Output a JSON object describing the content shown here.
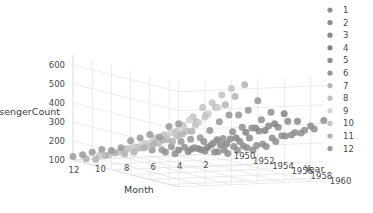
{
  "chart_data": {
    "type": "scatter",
    "title": "",
    "projection": "3d",
    "xlabel": "Month",
    "ylabel": "Year",
    "zlabel": "PassengerCount",
    "x_ticks": [
      12,
      10,
      8,
      6,
      4,
      2
    ],
    "y_ticks": [
      1950,
      1952,
      1954,
      1956,
      1958,
      1960
    ],
    "z_ticks": [
      100,
      200,
      300,
      400,
      500,
      600
    ],
    "xlim": [
      13,
      1
    ],
    "ylim": [
      1949,
      1961
    ],
    "zlim": [
      100,
      650
    ],
    "grid": true,
    "legend_title": "",
    "legend_position": "right",
    "legend_entries": [
      {
        "label": "1",
        "color": "#8e8e8e"
      },
      {
        "label": "2",
        "color": "#8c8c8c"
      },
      {
        "label": "3",
        "color": "#8a8a8a"
      },
      {
        "label": "4",
        "color": "#848484"
      },
      {
        "label": "5",
        "color": "#8f8f8f"
      },
      {
        "label": "6",
        "color": "#959595"
      },
      {
        "label": "7",
        "color": "#b4b4b4"
      },
      {
        "label": "8",
        "color": "#c2c2c2"
      },
      {
        "label": "9",
        "color": "#d2d2d2"
      },
      {
        "label": "10",
        "color": "#c4c4c4"
      },
      {
        "label": "11",
        "color": "#b0b0b0"
      },
      {
        "label": "12",
        "color": "#9a9a9a"
      }
    ],
    "series_key": "Month",
    "point_opacity": 0.85,
    "point_size": 7,
    "x": "Month",
    "y": "Year",
    "z": "PassengerCount",
    "points": [
      {
        "year": 1949,
        "month": 1,
        "value": 112
      },
      {
        "year": 1949,
        "month": 2,
        "value": 118
      },
      {
        "year": 1949,
        "month": 3,
        "value": 132
      },
      {
        "year": 1949,
        "month": 4,
        "value": 129
      },
      {
        "year": 1949,
        "month": 5,
        "value": 121
      },
      {
        "year": 1949,
        "month": 6,
        "value": 135
      },
      {
        "year": 1949,
        "month": 7,
        "value": 148
      },
      {
        "year": 1949,
        "month": 8,
        "value": 148
      },
      {
        "year": 1949,
        "month": 9,
        "value": 136
      },
      {
        "year": 1949,
        "month": 10,
        "value": 119
      },
      {
        "year": 1949,
        "month": 11,
        "value": 104
      },
      {
        "year": 1949,
        "month": 12,
        "value": 118
      },
      {
        "year": 1950,
        "month": 1,
        "value": 115
      },
      {
        "year": 1950,
        "month": 2,
        "value": 126
      },
      {
        "year": 1950,
        "month": 3,
        "value": 141
      },
      {
        "year": 1950,
        "month": 4,
        "value": 135
      },
      {
        "year": 1950,
        "month": 5,
        "value": 125
      },
      {
        "year": 1950,
        "month": 6,
        "value": 149
      },
      {
        "year": 1950,
        "month": 7,
        "value": 170
      },
      {
        "year": 1950,
        "month": 8,
        "value": 170
      },
      {
        "year": 1950,
        "month": 9,
        "value": 158
      },
      {
        "year": 1950,
        "month": 10,
        "value": 133
      },
      {
        "year": 1950,
        "month": 11,
        "value": 114
      },
      {
        "year": 1950,
        "month": 12,
        "value": 140
      },
      {
        "year": 1951,
        "month": 1,
        "value": 145
      },
      {
        "year": 1951,
        "month": 2,
        "value": 150
      },
      {
        "year": 1951,
        "month": 3,
        "value": 178
      },
      {
        "year": 1951,
        "month": 4,
        "value": 163
      },
      {
        "year": 1951,
        "month": 5,
        "value": 172
      },
      {
        "year": 1951,
        "month": 6,
        "value": 178
      },
      {
        "year": 1951,
        "month": 7,
        "value": 199
      },
      {
        "year": 1951,
        "month": 8,
        "value": 199
      },
      {
        "year": 1951,
        "month": 9,
        "value": 184
      },
      {
        "year": 1951,
        "month": 10,
        "value": 162
      },
      {
        "year": 1951,
        "month": 11,
        "value": 146
      },
      {
        "year": 1951,
        "month": 12,
        "value": 166
      },
      {
        "year": 1952,
        "month": 1,
        "value": 171
      },
      {
        "year": 1952,
        "month": 2,
        "value": 180
      },
      {
        "year": 1952,
        "month": 3,
        "value": 193
      },
      {
        "year": 1952,
        "month": 4,
        "value": 181
      },
      {
        "year": 1952,
        "month": 5,
        "value": 183
      },
      {
        "year": 1952,
        "month": 6,
        "value": 218
      },
      {
        "year": 1952,
        "month": 7,
        "value": 230
      },
      {
        "year": 1952,
        "month": 8,
        "value": 242
      },
      {
        "year": 1952,
        "month": 9,
        "value": 209
      },
      {
        "year": 1952,
        "month": 10,
        "value": 191
      },
      {
        "year": 1952,
        "month": 11,
        "value": 172
      },
      {
        "year": 1952,
        "month": 12,
        "value": 194
      },
      {
        "year": 1953,
        "month": 1,
        "value": 196
      },
      {
        "year": 1953,
        "month": 2,
        "value": 196
      },
      {
        "year": 1953,
        "month": 3,
        "value": 236
      },
      {
        "year": 1953,
        "month": 4,
        "value": 235
      },
      {
        "year": 1953,
        "month": 5,
        "value": 229
      },
      {
        "year": 1953,
        "month": 6,
        "value": 243
      },
      {
        "year": 1953,
        "month": 7,
        "value": 264
      },
      {
        "year": 1953,
        "month": 8,
        "value": 272
      },
      {
        "year": 1953,
        "month": 9,
        "value": 237
      },
      {
        "year": 1953,
        "month": 10,
        "value": 211
      },
      {
        "year": 1953,
        "month": 11,
        "value": 180
      },
      {
        "year": 1953,
        "month": 12,
        "value": 201
      },
      {
        "year": 1954,
        "month": 1,
        "value": 204
      },
      {
        "year": 1954,
        "month": 2,
        "value": 188
      },
      {
        "year": 1954,
        "month": 3,
        "value": 235
      },
      {
        "year": 1954,
        "month": 4,
        "value": 227
      },
      {
        "year": 1954,
        "month": 5,
        "value": 234
      },
      {
        "year": 1954,
        "month": 6,
        "value": 264
      },
      {
        "year": 1954,
        "month": 7,
        "value": 302
      },
      {
        "year": 1954,
        "month": 8,
        "value": 293
      },
      {
        "year": 1954,
        "month": 9,
        "value": 259
      },
      {
        "year": 1954,
        "month": 10,
        "value": 229
      },
      {
        "year": 1954,
        "month": 11,
        "value": 203
      },
      {
        "year": 1954,
        "month": 12,
        "value": 229
      },
      {
        "year": 1955,
        "month": 1,
        "value": 242
      },
      {
        "year": 1955,
        "month": 2,
        "value": 233
      },
      {
        "year": 1955,
        "month": 3,
        "value": 267
      },
      {
        "year": 1955,
        "month": 4,
        "value": 269
      },
      {
        "year": 1955,
        "month": 5,
        "value": 270
      },
      {
        "year": 1955,
        "month": 6,
        "value": 315
      },
      {
        "year": 1955,
        "month": 7,
        "value": 364
      },
      {
        "year": 1955,
        "month": 8,
        "value": 347
      },
      {
        "year": 1955,
        "month": 9,
        "value": 312
      },
      {
        "year": 1955,
        "month": 10,
        "value": 274
      },
      {
        "year": 1955,
        "month": 11,
        "value": 237
      },
      {
        "year": 1955,
        "month": 12,
        "value": 278
      },
      {
        "year": 1956,
        "month": 1,
        "value": 284
      },
      {
        "year": 1956,
        "month": 2,
        "value": 277
      },
      {
        "year": 1956,
        "month": 3,
        "value": 317
      },
      {
        "year": 1956,
        "month": 4,
        "value": 313
      },
      {
        "year": 1956,
        "month": 5,
        "value": 318
      },
      {
        "year": 1956,
        "month": 6,
        "value": 374
      },
      {
        "year": 1956,
        "month": 7,
        "value": 413
      },
      {
        "year": 1956,
        "month": 8,
        "value": 405
      },
      {
        "year": 1956,
        "month": 9,
        "value": 355
      },
      {
        "year": 1956,
        "month": 10,
        "value": 306
      },
      {
        "year": 1956,
        "month": 11,
        "value": 271
      },
      {
        "year": 1956,
        "month": 12,
        "value": 306
      },
      {
        "year": 1957,
        "month": 1,
        "value": 315
      },
      {
        "year": 1957,
        "month": 2,
        "value": 301
      },
      {
        "year": 1957,
        "month": 3,
        "value": 356
      },
      {
        "year": 1957,
        "month": 4,
        "value": 348
      },
      {
        "year": 1957,
        "month": 5,
        "value": 355
      },
      {
        "year": 1957,
        "month": 6,
        "value": 422
      },
      {
        "year": 1957,
        "month": 7,
        "value": 465
      },
      {
        "year": 1957,
        "month": 8,
        "value": 467
      },
      {
        "year": 1957,
        "month": 9,
        "value": 404
      },
      {
        "year": 1957,
        "month": 10,
        "value": 347
      },
      {
        "year": 1957,
        "month": 11,
        "value": 305
      },
      {
        "year": 1957,
        "month": 12,
        "value": 336
      },
      {
        "year": 1958,
        "month": 1,
        "value": 340
      },
      {
        "year": 1958,
        "month": 2,
        "value": 318
      },
      {
        "year": 1958,
        "month": 3,
        "value": 362
      },
      {
        "year": 1958,
        "month": 4,
        "value": 348
      },
      {
        "year": 1958,
        "month": 5,
        "value": 363
      },
      {
        "year": 1958,
        "month": 6,
        "value": 435
      },
      {
        "year": 1958,
        "month": 7,
        "value": 491
      },
      {
        "year": 1958,
        "month": 8,
        "value": 505
      },
      {
        "year": 1958,
        "month": 9,
        "value": 404
      },
      {
        "year": 1958,
        "month": 10,
        "value": 359
      },
      {
        "year": 1958,
        "month": 11,
        "value": 310
      },
      {
        "year": 1958,
        "month": 12,
        "value": 337
      },
      {
        "year": 1959,
        "month": 1,
        "value": 360
      },
      {
        "year": 1959,
        "month": 2,
        "value": 342
      },
      {
        "year": 1959,
        "month": 3,
        "value": 406
      },
      {
        "year": 1959,
        "month": 4,
        "value": 396
      },
      {
        "year": 1959,
        "month": 5,
        "value": 420
      },
      {
        "year": 1959,
        "month": 6,
        "value": 472
      },
      {
        "year": 1959,
        "month": 7,
        "value": 548
      },
      {
        "year": 1959,
        "month": 8,
        "value": 559
      },
      {
        "year": 1959,
        "month": 9,
        "value": 463
      },
      {
        "year": 1959,
        "month": 10,
        "value": 407
      },
      {
        "year": 1959,
        "month": 11,
        "value": 362
      },
      {
        "year": 1959,
        "month": 12,
        "value": 405
      },
      {
        "year": 1960,
        "month": 1,
        "value": 417
      },
      {
        "year": 1960,
        "month": 2,
        "value": 391
      },
      {
        "year": 1960,
        "month": 3,
        "value": 419
      },
      {
        "year": 1960,
        "month": 4,
        "value": 461
      },
      {
        "year": 1960,
        "month": 5,
        "value": 472
      },
      {
        "year": 1960,
        "month": 6,
        "value": 535
      },
      {
        "year": 1960,
        "month": 7,
        "value": 622
      },
      {
        "year": 1960,
        "month": 8,
        "value": 606
      },
      {
        "year": 1960,
        "month": 9,
        "value": 508
      },
      {
        "year": 1960,
        "month": 10,
        "value": 461
      },
      {
        "year": 1960,
        "month": 11,
        "value": 390
      },
      {
        "year": 1960,
        "month": 12,
        "value": 432
      }
    ]
  }
}
